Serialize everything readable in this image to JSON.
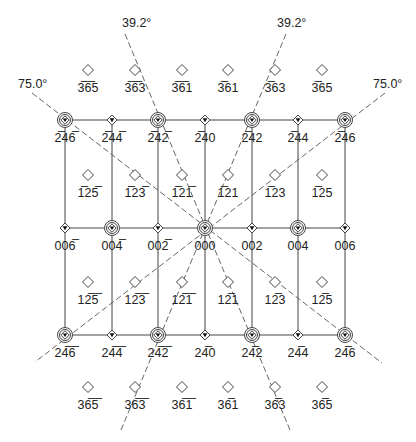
{
  "diagram": {
    "angle_labels": [
      {
        "id": "top-left-39",
        "text": "39.2°",
        "x": 122,
        "y": 27
      },
      {
        "id": "top-right-39",
        "text": "39.2°",
        "x": 277,
        "y": 27
      },
      {
        "id": "left-75",
        "text": "75.0°",
        "x": 18,
        "y": 88
      },
      {
        "id": "right-75",
        "text": "75.0°",
        "x": 373,
        "y": 88
      }
    ],
    "columns_x": [
      65,
      112,
      158,
      205,
      252,
      298,
      345
    ],
    "rows": [
      {
        "y": 70,
        "marker": "diamond",
        "label_offset": 16,
        "cols": [
          1,
          2,
          3,
          4,
          5,
          6
        ],
        "col_x": [
          88,
          135,
          182,
          228,
          275,
          322
        ],
        "labels": [
          "3̅6̅5",
          "3̅6̅3",
          "3̅6̅1",
          "3̅61",
          "3̅63",
          "3̅65"
        ]
      },
      {
        "y": 120,
        "marker_types": [
          "ring",
          "diamond-dot",
          "ring",
          "diamond-dot",
          "ring",
          "diamond-dot",
          "ring"
        ],
        "label_offset": 16,
        "labels": [
          "2̅46̅",
          "2̅44̅",
          "2̅42̅",
          "2̅40",
          "2̅42",
          "2̅44",
          "2̅46"
        ]
      },
      {
        "y": 175,
        "marker": "diamond",
        "label_offset": 16,
        "col_x": [
          88,
          135,
          182,
          228,
          275,
          322
        ],
        "labels": [
          "1̅25̅",
          "1̅23̅",
          "1̅21̅",
          "1̅21",
          "1̅23",
          "1̅25"
        ]
      },
      {
        "y": 228,
        "marker_types": [
          "diamond-dot",
          "ring",
          "diamond-dot",
          "ring",
          "diamond-dot",
          "ring",
          "diamond-dot"
        ],
        "label_offset": 16,
        "labels": [
          "006̅",
          "004̅",
          "002̅",
          "000",
          "002",
          "004",
          "006"
        ]
      },
      {
        "y": 282,
        "marker": "diamond",
        "label_offset": 16,
        "col_x": [
          88,
          135,
          182,
          228,
          275,
          322
        ],
        "labels": [
          "12̅5̅",
          "12̅3̅",
          "12̅1̅",
          "12̅1",
          "12̅3",
          "12̅5"
        ]
      },
      {
        "y": 335,
        "marker_types": [
          "ring",
          "diamond-dot",
          "ring",
          "diamond-dot",
          "ring",
          "diamond-dot",
          "ring"
        ],
        "label_offset": 16,
        "labels": [
          "24̅6̅",
          "24̅4̅",
          "24̅2̅",
          "24̅0",
          "24̅2",
          "24̅4",
          "24̅6"
        ]
      },
      {
        "y": 387,
        "marker": "diamond",
        "label_offset": 16,
        "col_x": [
          88,
          135,
          182,
          228,
          275,
          322
        ],
        "labels": [
          "36̅5̅",
          "36̅3̅",
          "36̅1̅",
          "36̅1",
          "36̅3",
          "36̅5"
        ]
      }
    ],
    "dashed_lines": [
      {
        "id": "line-39-left",
        "x1": 125,
        "y1": 34,
        "x2": 290,
        "y2": 430
      },
      {
        "id": "line-39-right",
        "x1": 286,
        "y1": 34,
        "x2": 121,
        "y2": 430
      },
      {
        "id": "line-75-left",
        "x1": 32,
        "y1": 93,
        "x2": 382,
        "y2": 363
      },
      {
        "id": "line-75-right",
        "x1": 385,
        "y1": 93,
        "x2": 35,
        "y2": 362
      }
    ],
    "colors": {
      "line": "#444444",
      "dash": "#555555",
      "text": "#222222",
      "background": "#ffffff"
    }
  }
}
